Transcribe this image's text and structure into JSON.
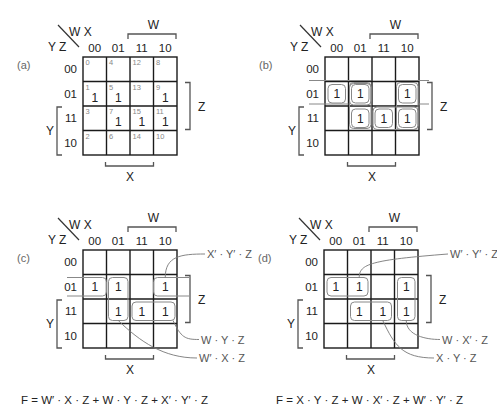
{
  "figure": {
    "variables": {
      "row_vars": "Y Z",
      "col_vars": "W X"
    },
    "column_headers": [
      "00",
      "01",
      "11",
      "10"
    ],
    "row_headers": [
      "00",
      "01",
      "11",
      "10"
    ],
    "axis_labels": {
      "W": "W",
      "X": "X",
      "Y": "Y",
      "Z": "Z"
    },
    "panels": [
      {
        "id": "a",
        "tag": "(a)",
        "cell_indices": [
          [
            "0",
            "4",
            "12",
            "8"
          ],
          [
            "1",
            "5",
            "13",
            "9"
          ],
          [
            "3",
            "7",
            "15",
            "11"
          ],
          [
            "2",
            "6",
            "14",
            "10"
          ]
        ],
        "cells": [
          [
            "",
            "",
            "",
            ""
          ],
          [
            "1",
            "1",
            "",
            "1"
          ],
          [
            "",
            "1",
            "1",
            "1"
          ],
          [
            "",
            "",
            "",
            ""
          ]
        ]
      },
      {
        "id": "b",
        "tag": "(b)",
        "cells": [
          [
            "",
            "",
            "",
            ""
          ],
          [
            "1",
            "1",
            "",
            "1"
          ],
          [
            "",
            "1",
            "1",
            "1"
          ],
          [
            "",
            "",
            "",
            ""
          ]
        ]
      },
      {
        "id": "c",
        "tag": "(c)",
        "cells": [
          [
            "",
            "",
            "",
            ""
          ],
          [
            "1",
            "1",
            "",
            "1"
          ],
          [
            "",
            "1",
            "1",
            "1"
          ],
          [
            "",
            "",
            "",
            ""
          ]
        ],
        "terms": [
          "X′ · Y′ · Z",
          "W · Y · Z",
          "W′ · X · Z"
        ],
        "equation": "F = W′ · X · Z + W · Y · Z + X′ · Y′ · Z"
      },
      {
        "id": "d",
        "tag": "(d)",
        "cells": [
          [
            "",
            "",
            "",
            ""
          ],
          [
            "1",
            "1",
            "",
            "1"
          ],
          [
            "",
            "1",
            "1",
            "1"
          ],
          [
            "",
            "",
            "",
            ""
          ]
        ],
        "terms": [
          "W′ · Y′ · Z",
          "W · X′ · Z",
          "X · Y · Z"
        ],
        "equation": "F = X · Y · Z + W · X′ · Z + W′ · Y′ · Z"
      }
    ]
  }
}
